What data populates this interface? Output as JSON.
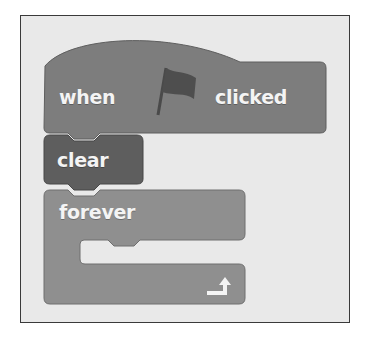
{
  "script": {
    "hat_block": {
      "label_before": "when",
      "icon": "green-flag-icon",
      "label_after": "clicked"
    },
    "command_block": {
      "label": "clear"
    },
    "loop_block": {
      "label": "forever",
      "end_icon": "loop-arrow-icon"
    }
  },
  "colors": {
    "background": "#e9e9e9",
    "hat_block": "#7d7d7d",
    "command_block": "#5e5e5e",
    "loop_block": "#8f8f8f",
    "flag": "#4e4e4e",
    "label": "#f4f4f4"
  }
}
